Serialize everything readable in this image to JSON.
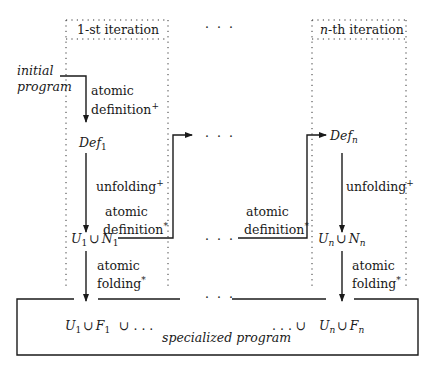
{
  "diagram": {
    "iterations": [
      {
        "header": "1-st iteration",
        "header_prefix": "",
        "def": "Def",
        "def_sub": "1",
        "un_left": "U",
        "un_sub": "1",
        "un_right": "N",
        "un_right_sub": "1",
        "uf_left": "U",
        "uf_sub": "1",
        "uf_right": "F",
        "uf_right_sub": "1"
      },
      {
        "header": "-th iteration",
        "header_prefix": "n",
        "def": "Def",
        "def_sub": "n",
        "un_left": "U",
        "un_sub": "n",
        "un_right": "N",
        "un_right_sub": "n",
        "uf_left": "U",
        "uf_sub": "n",
        "uf_right": "F",
        "uf_right_sub": "n"
      }
    ],
    "input_label_line1": "initial",
    "input_label_line2": "program",
    "steps": {
      "atomic_definition_plus": {
        "line1": "atomic",
        "line2": "definition",
        "sup": "+"
      },
      "unfolding_plus": {
        "line1": "unfolding",
        "sup": "+"
      },
      "atomic_definition_star": {
        "line1": "atomic",
        "line2": "definition",
        "sup": "*"
      },
      "atomic_folding_star": {
        "line1": "atomic",
        "line2": "folding",
        "sup": "*"
      }
    },
    "union_symbol": "∪",
    "ellipsis": "· · ·",
    "union_ellipsis_right": "∪ . . .",
    "union_ellipsis_left": ". . . ∪",
    "output_label": "specialized program",
    "colors": {
      "line": "#1a1a1a",
      "dotted": "#333333",
      "background": "#ffffff"
    }
  }
}
